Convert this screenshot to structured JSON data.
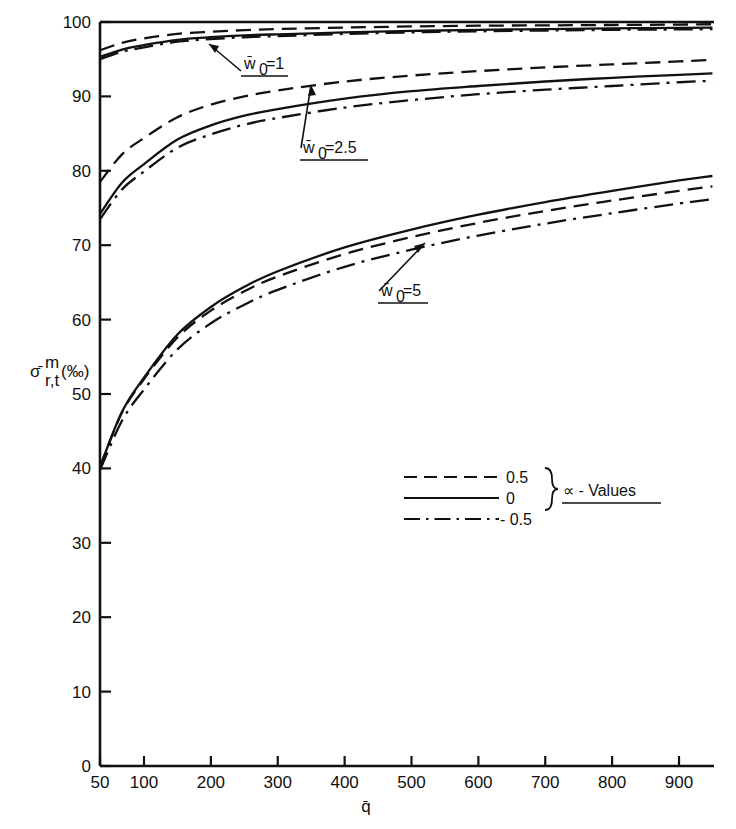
{
  "chart_data": {
    "type": "line",
    "title": "",
    "xlabel": "q̄",
    "ylabel": "σ̄ᵐ r,t (%)",
    "ylabel_parts": {
      "base": "σ̄",
      "superscript": "m",
      "subscript": "r,t",
      "unit": "(‰)"
    },
    "xlim": [
      50,
      960
    ],
    "ylim": [
      0,
      100
    ],
    "grid": false,
    "x_ticks": [
      50,
      100,
      200,
      300,
      400,
      500,
      600,
      700,
      800,
      900
    ],
    "x_tick_labels": [
      "50",
      "100",
      "200",
      "300",
      "400",
      "500",
      "600",
      "700",
      "800",
      "900"
    ],
    "y_ticks": [
      0,
      10,
      20,
      30,
      40,
      50,
      60,
      70,
      80,
      90,
      100
    ],
    "y_tick_labels": [
      "0",
      "10",
      "20",
      "30",
      "40",
      "50",
      "60",
      "70",
      "80",
      "90",
      "100"
    ],
    "legend_position": "lower-right",
    "legend_title": "∝ - Values",
    "legend_entries": [
      {
        "label": "0.5",
        "style": "dashed"
      },
      {
        "label": "0",
        "style": "solid"
      },
      {
        "label": "- 0.5",
        "style": "dashdot"
      }
    ],
    "annotations": [
      {
        "text": "w̄₀ = 1",
        "group": "w0_1"
      },
      {
        "text": "w̄₀ = 2.5",
        "group": "w0_2p5"
      },
      {
        "text": "w̄₀ = 5",
        "group": "w0_5"
      }
    ],
    "groups": [
      {
        "name": "w0_1",
        "label": "w̄₀ = 1",
        "x": [
          50,
          75,
          100,
          150,
          200,
          250,
          300,
          400,
          500,
          600,
          700,
          800,
          900,
          950
        ],
        "series": [
          {
            "name": "alpha = 0.5",
            "style": "dashed",
            "values": [
              96.2,
              97.2,
              97.8,
              98.4,
              98.7,
              98.9,
              99.05,
              99.25,
              99.4,
              99.5,
              99.55,
              99.6,
              99.65,
              99.7
            ]
          },
          {
            "name": "alpha = 0",
            "style": "solid",
            "values": [
              95.3,
              96.3,
              96.9,
              97.6,
              97.95,
              98.2,
              98.35,
              98.6,
              98.8,
              98.95,
              99.05,
              99.15,
              99.2,
              99.25
            ]
          },
          {
            "name": "alpha = -0.5",
            "style": "dashdot",
            "values": [
              95.0,
              96.0,
              96.6,
              97.35,
              97.7,
              97.95,
              98.1,
              98.4,
              98.6,
              98.75,
              98.85,
              98.95,
              99.0,
              99.05
            ]
          }
        ]
      },
      {
        "name": "w0_2p5",
        "label": "w̄₀ = 2.5",
        "x": [
          50,
          75,
          100,
          150,
          200,
          250,
          300,
          400,
          500,
          600,
          700,
          800,
          900,
          950
        ],
        "series": [
          {
            "name": "alpha = 0.5",
            "style": "dashed",
            "values": [
              78.5,
              82.2,
              84.4,
              87.2,
              88.9,
              90.0,
              90.8,
              92.0,
              92.8,
              93.4,
              93.9,
              94.3,
              94.7,
              94.9
            ]
          },
          {
            "name": "alpha = 0",
            "style": "solid",
            "values": [
              74.2,
              78.4,
              80.9,
              84.2,
              86.1,
              87.4,
              88.3,
              89.7,
              90.7,
              91.4,
              92.0,
              92.5,
              92.9,
              93.1
            ]
          },
          {
            "name": "alpha = -0.5",
            "style": "dashdot",
            "values": [
              73.5,
              77.5,
              79.9,
              83.1,
              84.9,
              86.2,
              87.1,
              88.5,
              89.5,
              90.3,
              90.9,
              91.4,
              91.9,
              92.1
            ]
          }
        ]
      },
      {
        "name": "w0_5",
        "label": "w̄₀ = 5",
        "x": [
          50,
          75,
          100,
          150,
          200,
          250,
          300,
          400,
          500,
          600,
          700,
          800,
          900,
          950
        ],
        "series": [
          {
            "name": "alpha = 0.5",
            "style": "dashed",
            "values": [
              40.2,
              47.5,
              52.0,
              57.6,
              61.2,
              63.8,
              65.8,
              68.8,
              71.1,
              73.0,
              74.6,
              76.0,
              77.3,
              77.9
            ]
          },
          {
            "name": "alpha = 0",
            "style": "solid",
            "values": [
              40.2,
              47.6,
              52.2,
              58.0,
              61.7,
              64.4,
              66.5,
              69.7,
              72.1,
              74.1,
              75.8,
              77.3,
              78.7,
              79.3
            ]
          },
          {
            "name": "alpha = -0.5",
            "style": "dashdot",
            "values": [
              39.8,
              46.4,
              50.6,
              56.0,
              59.5,
              62.0,
              64.0,
              67.1,
              69.4,
              71.3,
              72.9,
              74.3,
              75.6,
              76.2
            ]
          }
        ]
      }
    ]
  }
}
